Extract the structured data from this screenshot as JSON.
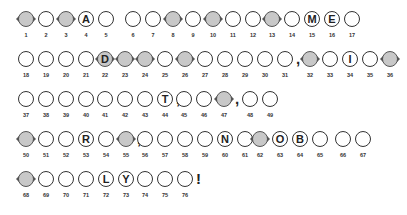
{
  "puzzle": {
    "rows": [
      {
        "top": 11,
        "groups": [
          {
            "left": 16,
            "cells": [
              {
                "n": "1",
                "letter": "",
                "shaded": true
              },
              {
                "n": "2",
                "letter": "",
                "shaded": false
              },
              {
                "n": "3",
                "letter": "",
                "shaded": true
              },
              {
                "n": "4",
                "letter": "A",
                "shaded": false
              },
              {
                "n": "5",
                "letter": "",
                "shaded": false
              }
            ],
            "punct": ""
          },
          {
            "left": 123,
            "cells": [
              {
                "n": "6",
                "letter": "",
                "shaded": false
              },
              {
                "n": "7",
                "letter": "",
                "shaded": false
              },
              {
                "n": "8",
                "letter": "",
                "shaded": true
              },
              {
                "n": "9",
                "letter": "",
                "shaded": false
              },
              {
                "n": "10",
                "letter": "",
                "shaded": true
              },
              {
                "n": "11",
                "letter": "",
                "shaded": false
              },
              {
                "n": "12",
                "letter": "",
                "shaded": false
              }
            ],
            "punct": ""
          },
          {
            "left": 262,
            "cells": [
              {
                "n": "13",
                "letter": "",
                "shaded": true
              },
              {
                "n": "14",
                "letter": "",
                "shaded": false
              },
              {
                "n": "15",
                "letter": "M",
                "shaded": false
              },
              {
                "n": "16",
                "letter": "E",
                "shaded": false
              },
              {
                "n": "17",
                "letter": "",
                "shaded": false
              }
            ],
            "punct": ""
          }
        ]
      },
      {
        "top": 51,
        "groups": [
          {
            "left": 16,
            "cells": [
              {
                "n": "18",
                "letter": "",
                "shaded": false
              },
              {
                "n": "19",
                "letter": "",
                "shaded": false
              },
              {
                "n": "20",
                "letter": "",
                "shaded": false
              },
              {
                "n": "21",
                "letter": "",
                "shaded": false
              }
            ],
            "punct": ""
          },
          {
            "left": 95,
            "cells": [
              {
                "n": "22",
                "letter": "D",
                "shaded": true
              },
              {
                "n": "23",
                "letter": "",
                "shaded": true
              },
              {
                "n": "24",
                "letter": "",
                "shaded": true
              },
              {
                "n": "25",
                "letter": "",
                "shaded": false
              },
              {
                "n": "26",
                "letter": "",
                "shaded": true
              },
              {
                "n": "27",
                "letter": "",
                "shaded": false
              },
              {
                "n": "28",
                "letter": "",
                "shaded": false
              },
              {
                "n": "29",
                "letter": "",
                "shaded": false
              },
              {
                "n": "30",
                "letter": "",
                "shaded": false
              },
              {
                "n": "31",
                "letter": "",
                "shaded": false
              }
            ],
            "punct": ","
          },
          {
            "left": 300,
            "cells": [
              {
                "n": "32",
                "letter": "",
                "shaded": true
              },
              {
                "n": "33",
                "letter": "",
                "shaded": false
              },
              {
                "n": "34",
                "letter": "I",
                "shaded": false
              },
              {
                "n": "35",
                "letter": "",
                "shaded": false
              },
              {
                "n": "36",
                "letter": "",
                "shaded": true
              }
            ],
            "punct": ""
          }
        ]
      },
      {
        "top": 91,
        "groups": [
          {
            "left": 16,
            "cells": [
              {
                "n": "37",
                "letter": "",
                "shaded": false
              },
              {
                "n": "38",
                "letter": "",
                "shaded": false
              },
              {
                "n": "39",
                "letter": "",
                "shaded": false
              },
              {
                "n": "40",
                "letter": "",
                "shaded": false
              }
            ],
            "punct": ""
          },
          {
            "left": 95,
            "cells": [
              {
                "n": "41",
                "letter": "",
                "shaded": false
              },
              {
                "n": "42",
                "letter": "",
                "shaded": false
              },
              {
                "n": "43",
                "letter": "",
                "shaded": false
              },
              {
                "n": "44",
                "letter": "T",
                "shaded": false
              }
            ],
            "punct": ","
          },
          {
            "left": 174,
            "cells": [
              {
                "n": "45",
                "letter": "",
                "shaded": false
              },
              {
                "n": "46",
                "letter": "",
                "shaded": false
              },
              {
                "n": "47",
                "letter": "",
                "shaded": true
              }
            ],
            "punct": ","
          },
          {
            "left": 240,
            "cells": [
              {
                "n": "48",
                "letter": "",
                "shaded": false
              },
              {
                "n": "49",
                "letter": "",
                "shaded": false
              }
            ],
            "punct": ""
          }
        ]
      },
      {
        "top": 131,
        "groups": [
          {
            "left": 16,
            "cells": [
              {
                "n": "50",
                "letter": "",
                "shaded": true
              },
              {
                "n": "51",
                "letter": "",
                "shaded": false
              },
              {
                "n": "52",
                "letter": "",
                "shaded": false
              },
              {
                "n": "53",
                "letter": "R",
                "shaded": false
              },
              {
                "n": "54",
                "letter": "",
                "shaded": false
              },
              {
                "n": "55",
                "letter": "",
                "shaded": true
              }
            ],
            "punct": ","
          },
          {
            "left": 135,
            "cells": [
              {
                "n": "56",
                "letter": "",
                "shaded": false
              },
              {
                "n": "57",
                "letter": "",
                "shaded": false
              },
              {
                "n": "58",
                "letter": "",
                "shaded": false
              },
              {
                "n": "59",
                "letter": "",
                "shaded": false
              },
              {
                "n": "60",
                "letter": "N",
                "shaded": false
              },
              {
                "n": "61",
                "letter": "",
                "shaded": false
              }
            ],
            "punct": ""
          },
          {
            "left": 250,
            "cells": [
              {
                "n": "62",
                "letter": "",
                "shaded": true
              },
              {
                "n": "63",
                "letter": "O",
                "shaded": false
              },
              {
                "n": "64",
                "letter": "B",
                "shaded": false
              },
              {
                "n": "65",
                "letter": "",
                "shaded": false
              }
            ],
            "punct": ""
          },
          {
            "left": 333,
            "cells": [
              {
                "n": "66",
                "letter": "",
                "shaded": false
              },
              {
                "n": "67",
                "letter": "",
                "shaded": false
              }
            ],
            "punct": ""
          }
        ]
      },
      {
        "top": 171,
        "groups": [
          {
            "left": 16,
            "cells": [
              {
                "n": "68",
                "letter": "",
                "shaded": true
              },
              {
                "n": "69",
                "letter": "",
                "shaded": false
              },
              {
                "n": "70",
                "letter": "",
                "shaded": false
              },
              {
                "n": "71",
                "letter": "",
                "shaded": false
              },
              {
                "n": "72",
                "letter": "L",
                "shaded": false
              },
              {
                "n": "73",
                "letter": "Y",
                "shaded": false
              }
            ],
            "punct": ""
          },
          {
            "left": 135,
            "cells": [
              {
                "n": "74",
                "letter": "",
                "shaded": false
              },
              {
                "n": "75",
                "letter": "",
                "shaded": false
              },
              {
                "n": "76",
                "letter": "",
                "shaded": false
              }
            ],
            "punct": "!"
          }
        ]
      }
    ]
  }
}
